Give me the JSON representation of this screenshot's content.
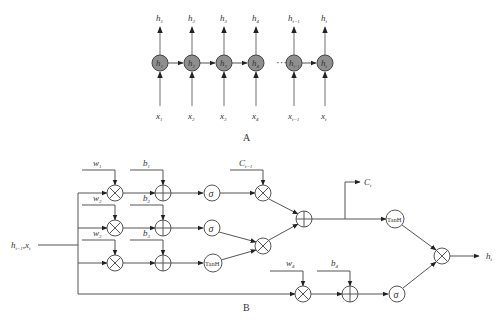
{
  "part_a": {
    "caption": "A",
    "ellipsis": "···",
    "cells": [
      {
        "node": "h",
        "node_sub": "1",
        "out": "h",
        "out_sub": "1",
        "in": "x",
        "in_sub": "1"
      },
      {
        "node": "h",
        "node_sub": "2",
        "out": "h",
        "out_sub": "2",
        "in": "x",
        "in_sub": "2"
      },
      {
        "node": "h",
        "node_sub": "3",
        "out": "h",
        "out_sub": "3",
        "in": "x",
        "in_sub": "3"
      },
      {
        "node": "h",
        "node_sub": "4",
        "out": "h",
        "out_sub": "4",
        "in": "x",
        "in_sub": "4"
      },
      {
        "node": "h",
        "node_sub": "t−1",
        "out": "h",
        "out_sub": "t−1",
        "in": "x",
        "in_sub": "t−1"
      },
      {
        "node": "h",
        "node_sub": "t",
        "out": "h",
        "out_sub": "t",
        "in": "x",
        "in_sub": "t"
      }
    ]
  },
  "part_b": {
    "caption": "B",
    "input_label": {
      "h": "h",
      "h_sub": "t−1",
      "sep": ",",
      "x": "x",
      "x_sub": "t"
    },
    "weights": [
      {
        "name": "w",
        "sub": "1"
      },
      {
        "name": "w",
        "sub": "2"
      },
      {
        "name": "w",
        "sub": "3"
      },
      {
        "name": "w",
        "sub": "4"
      }
    ],
    "biases": [
      {
        "name": "b",
        "sub": "1"
      },
      {
        "name": "b",
        "sub": "2"
      },
      {
        "name": "b",
        "sub": "3"
      },
      {
        "name": "b",
        "sub": "4"
      }
    ],
    "prev_cell": {
      "name": "C",
      "sub": "t−1"
    },
    "cell_out": {
      "name": "C",
      "sub": "t"
    },
    "hidden_out": {
      "name": "h",
      "sub": "t"
    },
    "sigma": "σ",
    "tanh": "TanH"
  }
}
